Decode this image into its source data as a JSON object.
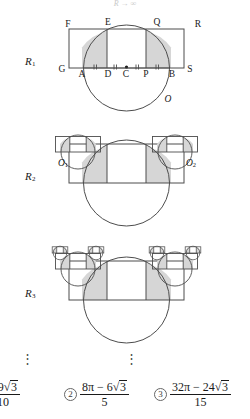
{
  "document": {
    "type": "geometry-figure-multiple-choice",
    "header_partial_text": "R → ∞"
  },
  "stages": [
    {
      "id": "R1",
      "label": "R",
      "subscript": "1",
      "label_x": 30,
      "label_y": 62,
      "point_labels": [
        {
          "text": "F",
          "x": 68,
          "y": 25
        },
        {
          "text": "E",
          "x": 108,
          "y": 23
        },
        {
          "text": "Q",
          "x": 157,
          "y": 23
        },
        {
          "text": "R",
          "x": 198,
          "y": 25
        },
        {
          "text": "G",
          "x": 62,
          "y": 70
        },
        {
          "text": "A",
          "x": 82,
          "y": 74
        },
        {
          "text": "D",
          "x": 108,
          "y": 74
        },
        {
          "text": "C",
          "x": 125,
          "y": 74
        },
        {
          "text": "P",
          "x": 146,
          "y": 74
        },
        {
          "text": "B",
          "x": 176,
          "y": 74
        },
        {
          "text": "S",
          "x": 191,
          "y": 70
        },
        {
          "text": "O",
          "x": 168,
          "y": 100
        }
      ]
    },
    {
      "id": "R2",
      "label": "R",
      "subscript": "2",
      "label_x": 30,
      "label_y": 177,
      "point_labels": [
        {
          "text": "O",
          "sub": "1",
          "x": 62,
          "y": 163
        },
        {
          "text": "O",
          "sub": "2",
          "x": 190,
          "y": 163
        }
      ]
    },
    {
      "id": "R3",
      "label": "R",
      "subscript": "3",
      "label_x": 30,
      "label_y": 294,
      "point_labels": []
    }
  ],
  "ellipses": [
    {
      "glyph": "⋮",
      "x": 27,
      "y": 358
    },
    {
      "glyph": "⋮",
      "x": 131,
      "y": 358
    }
  ],
  "choices": [
    {
      "number": "",
      "number_visible": false,
      "x": -14,
      "numerator_prefix": "",
      "numerator": "− 9",
      "numerator_radical": "3",
      "denominator": "10",
      "clipped": "left"
    },
    {
      "number": "2",
      "number_visible": true,
      "x": 64,
      "numerator_prefix": "8π − 6",
      "numerator": "8π − 6",
      "numerator_radical": "3",
      "denominator": "5",
      "clipped": "none"
    },
    {
      "number": "3",
      "number_visible": true,
      "x": 154,
      "numerator_prefix": "32π − 24",
      "numerator": "32π − 24",
      "numerator_radical": "3",
      "denominator": "15",
      "clipped": "right"
    }
  ],
  "style": {
    "stroke": "#4d4d4d",
    "stroke_dark": "#333333",
    "shade_fill": "#d6d6d6",
    "background": "#ffffff"
  }
}
